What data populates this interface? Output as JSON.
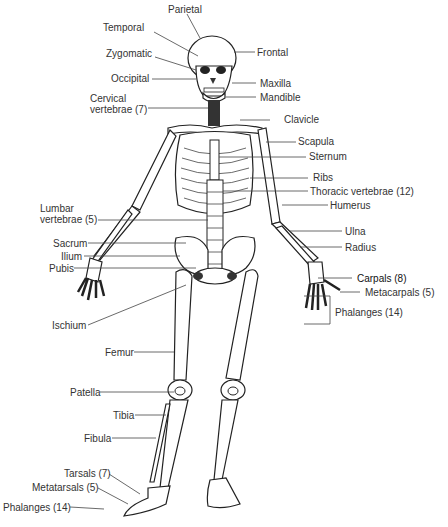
{
  "labels": {
    "parietal": "Parietal",
    "temporal": "Temporal",
    "zygomatic": "Zygomatic",
    "occipital": "Occipital",
    "frontal": "Frontal",
    "maxilla": "Maxilla",
    "mandible": "Mandible",
    "cervical_1": "Cervical",
    "cervical_2": "vertebrae (7)",
    "clavicle": "Clavicle",
    "scapula": "Scapula",
    "sternum": "Sternum",
    "ribs": "Ribs",
    "thoracic": "Thoracic vertebrae (12)",
    "humerus": "Humerus",
    "lumbar_1": "Lumbar",
    "lumbar_2": "vertebrae (5)",
    "ulna": "Ulna",
    "radius": "Radius",
    "sacrum": "Sacrum",
    "ilium": "Ilium",
    "pubis": "Pubis",
    "carpals": "Carpals (8)",
    "metacarpals": "Metacarpals (5)",
    "hand_phalanges": "Phalanges (14)",
    "ischium": "Ischium",
    "femur": "Femur",
    "patella": "Patella",
    "tibia": "Tibia",
    "fibula": "Fibula",
    "tarsals": "Tarsals (7)",
    "metatarsals": "Metatarsals (5)",
    "foot_phalanges": "Phalanges (14)"
  }
}
